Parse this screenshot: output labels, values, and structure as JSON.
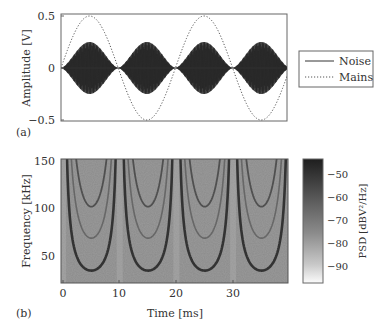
{
  "chart_data": [
    {
      "panel": "(a)",
      "type": "line",
      "xlabel": "",
      "ylabel": "Amplitude [V]",
      "ylim": [
        -0.5,
        0.5
      ],
      "yticks": [
        "0.5",
        "0",
        "−0.5"
      ],
      "xlim": [
        0,
        39.5
      ],
      "legend": {
        "position": "right",
        "entries": [
          "Noise",
          "Mains"
        ]
      },
      "series": [
        {
          "name": "Noise",
          "style": "solid",
          "description": "High-frequency burst, envelope peaks ±0.25 V at ~5, 15, 25, 35 ms; zero at 0, 10, 20, 30 ms",
          "envelope_peak": 0.25
        },
        {
          "name": "Mains",
          "style": "dotted",
          "description": "Sinusoid, amplitude 0.5 V, period 20 ms (50 Hz)",
          "amplitude": 0.5,
          "period_ms": 20
        }
      ]
    },
    {
      "panel": "(b)",
      "type": "heatmap",
      "xlabel": "Time [ms]",
      "ylabel": "Frequency [kHz]",
      "xticks": [
        "0",
        "10",
        "20",
        "30"
      ],
      "yticks": [
        "150",
        "100",
        "50"
      ],
      "xlim": [
        0,
        39.5
      ],
      "ylim": [
        20,
        150
      ],
      "colorbar": {
        "label": "PSD [dBV²/Hz]",
        "ticks": [
          "−50",
          "−60",
          "−70",
          "−80",
          "−90"
        ],
        "range": [
          -97,
          -45
        ]
      },
      "features": [
        {
          "name": "fundamental arc",
          "min_frequency_khz": 33,
          "min_at_ms": [
            4.5,
            14.5,
            24.5,
            34.5
          ]
        },
        {
          "name": "second arc",
          "min_frequency_khz": 67,
          "min_at_ms": [
            4.5,
            14.5,
            24.5,
            34.5
          ]
        },
        {
          "name": "third arc",
          "min_frequency_khz": 100,
          "min_at_ms": [
            4.5,
            14.5,
            24.5,
            34.5
          ]
        }
      ]
    }
  ],
  "labels": {
    "panel_a": "(a)",
    "panel_b": "(b)",
    "a_ylabel": "Amplitude [V]",
    "a_yt0": "0.5",
    "a_yt1": "0",
    "a_yt2": "−0.5",
    "legend_noise": "Noise",
    "legend_mains": "Mains",
    "b_ylabel": "Frequency [kHz]",
    "b_xlabel": "Time [ms]",
    "b_yt0": "150",
    "b_yt1": "100",
    "b_yt2": "50",
    "b_xt0": "0",
    "b_xt1": "10",
    "b_xt2": "20",
    "b_xt3": "30",
    "cb_label": "PSD [dBV²/Hz]",
    "cb_t0": "−50",
    "cb_t1": "−60",
    "cb_t2": "−70",
    "cb_t3": "−80",
    "cb_t4": "−90"
  }
}
